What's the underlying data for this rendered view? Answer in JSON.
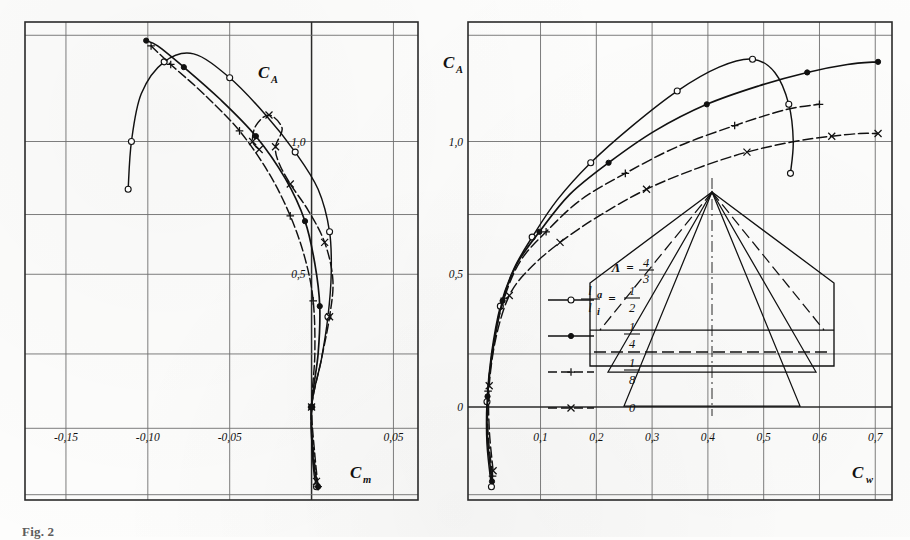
{
  "figure": {
    "caption": "Fig. 2. Messergebnisse",
    "caption_visible_fragment": "Fig. 2",
    "panels": [
      "moment-polar",
      "drag-polar"
    ]
  },
  "left_chart": {
    "y_axis_name": "C",
    "y_axis_sub": "A",
    "x_axis_name": "C",
    "x_axis_sub": "m",
    "x_ticks": [
      "-0,15",
      "-0,10",
      "-0,05",
      "0,05"
    ],
    "y_inline_labels": [
      "1,0",
      "0,5"
    ]
  },
  "right_chart": {
    "y_axis_name": "C",
    "y_axis_sub": "A",
    "x_axis_name": "C",
    "x_axis_sub": "w",
    "x_ticks": [
      "0,1",
      "0,2",
      "0,3",
      "0,4",
      "0,5",
      "0,6",
      "0,7"
    ],
    "y_ticks": [
      "0",
      "0,5",
      "1,0"
    ]
  },
  "legend": {
    "aspect_symbol": "Λ",
    "aspect_equals": "=",
    "aspect_num": "4",
    "aspect_den": "3",
    "ratio_num": "l",
    "ratio_num_sub": "a",
    "ratio_den": "l",
    "ratio_den_sub": "i",
    "ratio_equals": "=",
    "entries": [
      {
        "marker": "open-circle",
        "num": "1",
        "den": "2",
        "dashed": false
      },
      {
        "marker": "filled-circle",
        "num": "1",
        "den": "4",
        "dashed": false
      },
      {
        "marker": "plus",
        "num": "1",
        "den": "8",
        "dashed": true
      },
      {
        "marker": "cross",
        "num": "0",
        "den": "",
        "dashed": true
      }
    ]
  },
  "chart_data": [
    {
      "type": "line",
      "id": "moment-polar",
      "title": "",
      "xlabel": "C_m",
      "ylabel": "C_A",
      "xlim": [
        -0.175,
        0.065
      ],
      "ylim": [
        -0.35,
        1.45
      ],
      "grid": true,
      "legend_position": "none",
      "xticks": [
        -0.15,
        -0.1,
        -0.05,
        0.05
      ],
      "xticklabels": [
        "-0,15",
        "-0,10",
        "-0,05",
        "0,05"
      ],
      "yticks": [
        0.5,
        1.0
      ],
      "yticklabels": [
        "0,5",
        "1,0"
      ],
      "series": [
        {
          "name": "l_a/l_i = 1/2",
          "marker": "open-circle",
          "dashed": false,
          "points": [
            [
              0.003,
              -0.3
            ],
            [
              0.001,
              -0.22
            ],
            [
              0.0,
              0.0
            ],
            [
              0.006,
              0.18
            ],
            [
              0.01,
              0.34
            ],
            [
              0.012,
              0.5
            ],
            [
              0.011,
              0.66
            ],
            [
              0.004,
              0.82
            ],
            [
              -0.01,
              0.96
            ],
            [
              -0.028,
              1.1
            ],
            [
              -0.05,
              1.24
            ],
            [
              -0.072,
              1.33
            ],
            [
              -0.09,
              1.3
            ],
            [
              -0.104,
              1.18
            ],
            [
              -0.11,
              1.0
            ],
            [
              -0.112,
              0.82
            ]
          ]
        },
        {
          "name": "l_a/l_i = 1/4",
          "marker": "filled-circle",
          "dashed": false,
          "points": [
            [
              0.004,
              -0.3
            ],
            [
              0.001,
              -0.2
            ],
            [
              0.0,
              0.0
            ],
            [
              0.004,
              0.2
            ],
            [
              0.005,
              0.38
            ],
            [
              0.002,
              0.54
            ],
            [
              -0.004,
              0.7
            ],
            [
              -0.016,
              0.86
            ],
            [
              -0.034,
              1.02
            ],
            [
              -0.056,
              1.16
            ],
            [
              -0.078,
              1.28
            ],
            [
              -0.094,
              1.36
            ],
            [
              -0.101,
              1.38
            ]
          ]
        },
        {
          "name": "l_a/l_i = 1/8",
          "marker": "plus",
          "dashed": true,
          "points": [
            [
              0.004,
              -0.3
            ],
            [
              0.002,
              -0.18
            ],
            [
              0.0,
              0.0
            ],
            [
              0.002,
              0.2
            ],
            [
              0.001,
              0.4
            ],
            [
              -0.004,
              0.56
            ],
            [
              -0.013,
              0.72
            ],
            [
              -0.026,
              0.88
            ],
            [
              -0.044,
              1.04
            ],
            [
              -0.066,
              1.18
            ],
            [
              -0.086,
              1.29
            ],
            [
              -0.098,
              1.36
            ]
          ]
        },
        {
          "name": "l_a/l_i = 0",
          "marker": "cross",
          "dashed": true,
          "points": [
            [
              0.003,
              -0.28
            ],
            [
              0.001,
              -0.15
            ],
            [
              0.0,
              0.0
            ],
            [
              0.006,
              0.18
            ],
            [
              0.011,
              0.34
            ],
            [
              0.013,
              0.48
            ],
            [
              0.008,
              0.62
            ],
            [
              -0.002,
              0.74
            ],
            [
              -0.013,
              0.84
            ],
            [
              -0.02,
              0.92
            ],
            [
              -0.022,
              0.98
            ],
            [
              -0.018,
              1.05
            ],
            [
              -0.026,
              1.1
            ],
            [
              -0.034,
              1.06
            ],
            [
              -0.036,
              1.0
            ],
            [
              -0.032,
              0.97
            ]
          ]
        }
      ]
    },
    {
      "type": "line",
      "id": "drag-polar",
      "title": "",
      "xlabel": "C_w",
      "ylabel": "C_A",
      "xlim": [
        -0.03,
        0.73
      ],
      "ylim": [
        -0.35,
        1.45
      ],
      "grid": true,
      "legend_position": "inside-lower-left",
      "xticks": [
        0.1,
        0.2,
        0.3,
        0.4,
        0.5,
        0.6,
        0.7
      ],
      "xticklabels": [
        "0,1",
        "0,2",
        "0,3",
        "0,4",
        "0,5",
        "0,6",
        "0,7"
      ],
      "yticks": [
        0,
        0.5,
        1.0
      ],
      "yticklabels": [
        "0",
        "0,5",
        "1,0"
      ],
      "series": [
        {
          "name": "l_a/l_i = 1/2",
          "marker": "open-circle",
          "dashed": false,
          "points": [
            [
              0.012,
              -0.3
            ],
            [
              0.004,
              -0.14
            ],
            [
              0.004,
              0.02
            ],
            [
              0.012,
              0.2
            ],
            [
              0.028,
              0.38
            ],
            [
              0.052,
              0.52
            ],
            [
              0.085,
              0.64
            ],
            [
              0.13,
              0.78
            ],
            [
              0.19,
              0.92
            ],
            [
              0.265,
              1.06
            ],
            [
              0.345,
              1.19
            ],
            [
              0.42,
              1.28
            ],
            [
              0.48,
              1.31
            ],
            [
              0.52,
              1.26
            ],
            [
              0.545,
              1.14
            ],
            [
              0.553,
              1.0
            ],
            [
              0.548,
              0.88
            ]
          ]
        },
        {
          "name": "l_a/l_i = 1/4",
          "marker": "filled-circle",
          "dashed": false,
          "points": [
            [
              0.013,
              -0.28
            ],
            [
              0.005,
              -0.12
            ],
            [
              0.005,
              0.04
            ],
            [
              0.015,
              0.22
            ],
            [
              0.032,
              0.4
            ],
            [
              0.058,
              0.54
            ],
            [
              0.098,
              0.66
            ],
            [
              0.152,
              0.8
            ],
            [
              0.222,
              0.92
            ],
            [
              0.305,
              1.04
            ],
            [
              0.398,
              1.14
            ],
            [
              0.492,
              1.21
            ],
            [
              0.578,
              1.26
            ],
            [
              0.65,
              1.29
            ],
            [
              0.705,
              1.3
            ]
          ]
        },
        {
          "name": "l_a/l_i = 1/8",
          "marker": "plus",
          "dashed": true,
          "points": [
            [
              0.014,
              -0.26
            ],
            [
              0.006,
              -0.1
            ],
            [
              0.006,
              0.06
            ],
            [
              0.016,
              0.24
            ],
            [
              0.035,
              0.41
            ],
            [
              0.064,
              0.55
            ],
            [
              0.11,
              0.66
            ],
            [
              0.172,
              0.78
            ],
            [
              0.252,
              0.88
            ],
            [
              0.345,
              0.98
            ],
            [
              0.448,
              1.06
            ],
            [
              0.54,
              1.12
            ],
            [
              0.6,
              1.14
            ]
          ]
        },
        {
          "name": "l_a/l_i = 0",
          "marker": "cross",
          "dashed": true,
          "points": [
            [
              0.015,
              -0.24
            ],
            [
              0.008,
              -0.08
            ],
            [
              0.008,
              0.08
            ],
            [
              0.02,
              0.26
            ],
            [
              0.044,
              0.42
            ],
            [
              0.08,
              0.52
            ],
            [
              0.135,
              0.62
            ],
            [
              0.205,
              0.72
            ],
            [
              0.29,
              0.82
            ],
            [
              0.382,
              0.9
            ],
            [
              0.47,
              0.96
            ],
            [
              0.555,
              1.0
            ],
            [
              0.622,
              1.02
            ],
            [
              0.672,
              1.03
            ],
            [
              0.705,
              1.03
            ]
          ]
        }
      ]
    }
  ]
}
